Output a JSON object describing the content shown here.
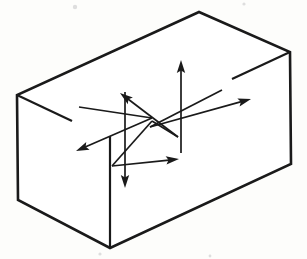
{
  "figure": {
    "background_color": "#fdfdfb",
    "ink_color": "#1a1a1a",
    "canvas": {
      "width": 307,
      "height": 259
    }
  },
  "box": {
    "name": "rectangular-block",
    "projection": "isometric",
    "stroke_color": "#1a1a1a",
    "fill_color": "#ffffff",
    "outline_stroke_width": 2.6,
    "interior_stroke_width": 2.2,
    "vertices": {
      "top_back": [
        199,
        12
      ],
      "top_left": [
        17,
        95
      ],
      "top_right": [
        290,
        52
      ],
      "top_front": [
        110,
        136
      ],
      "bottom_left": [
        18,
        200
      ],
      "bottom_front": [
        110,
        248
      ],
      "bottom_right": [
        291,
        164
      ]
    },
    "outline_path": "M 199 12 L 17 95 L 18 200 L 110 248 L 291 164 L 290 52 Z",
    "front_vertical_edge": {
      "from": [
        110,
        136
      ],
      "to": [
        110,
        248
      ]
    },
    "top_left_edge_stub": {
      "from": [
        17,
        95
      ],
      "to": [
        72,
        121
      ]
    },
    "top_right_edge_stub": {
      "from": [
        290,
        52
      ],
      "to": [
        232,
        79
      ]
    }
  },
  "arrows": {
    "name": "force-arrow-set",
    "count": 6,
    "origin": [
      152,
      121
    ],
    "stroke_width": 1.7,
    "head_length": 13,
    "head_half_width": 4.2,
    "items": [
      {
        "id": "arrow-up",
        "label": "up",
        "direction": "vertical-up",
        "axis": "vertical",
        "tail": [
          181,
          153
        ],
        "tip": [
          181,
          60
        ]
      },
      {
        "id": "arrow-down",
        "label": "down",
        "direction": "vertical-down",
        "axis": "vertical",
        "tail": [
          125,
          92
        ],
        "tip": [
          125,
          188
        ]
      },
      {
        "id": "arrow-upper-left",
        "label": "upper-left",
        "direction": "back-left",
        "axis": "depth",
        "tail": [
          178,
          137
        ],
        "tip": [
          120,
          93
        ]
      },
      {
        "id": "arrow-lower-right",
        "label": "lower-right",
        "direction": "front-right",
        "axis": "depth",
        "tail": [
          112,
          166
        ],
        "tip": [
          179,
          159
        ]
      },
      {
        "id": "arrow-lower-left",
        "label": "lower-left",
        "direction": "front-left",
        "axis": "width",
        "tail": [
          152,
          118
        ],
        "tip": [
          76,
          151
        ]
      },
      {
        "id": "arrow-upper-right",
        "label": "upper-right",
        "direction": "back-right",
        "axis": "width",
        "tail": [
          150,
          127
        ],
        "tip": [
          251,
          99
        ]
      }
    ]
  },
  "detail_lines": {
    "name": "arrow-crossing-lines",
    "segments": [
      {
        "id": "diag-a-tail",
        "from": [
          79,
          107
        ],
        "to": [
          152,
          118
        ]
      },
      {
        "id": "diag-b-tail",
        "from": [
          222,
          90
        ],
        "to": [
          150,
          127
        ]
      },
      {
        "id": "diag-c-tail",
        "from": [
          112,
          166
        ],
        "to": [
          152,
          121
        ]
      },
      {
        "id": "diag-d-tail",
        "from": [
          178,
          137
        ],
        "to": [
          152,
          121
        ]
      }
    ]
  },
  "specks": [
    {
      "cx": 75,
      "cy": 7,
      "r": 2.2
    },
    {
      "cx": 244,
      "cy": 4,
      "r": 1.6
    },
    {
      "cx": 124,
      "cy": 70,
      "r": 1.8
    },
    {
      "cx": 258,
      "cy": 93,
      "r": 1.7
    },
    {
      "cx": 46,
      "cy": 104,
      "r": 1.5
    },
    {
      "cx": 100,
      "cy": 254,
      "r": 1.6
    },
    {
      "cx": 210,
      "cy": 256,
      "r": 1.4
    }
  ]
}
